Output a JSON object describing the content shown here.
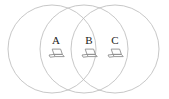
{
  "figure": {
    "type": "venn-diagram",
    "title": "",
    "background_color": "#ffffff",
    "circle_stroke_color": "#b9b9b9",
    "circle_stroke_width": 0.8,
    "label_color": "#222222",
    "icon_color": "#8f8f8f",
    "circles": [
      {
        "id": "circle-left",
        "cx": 52,
        "cy": 49,
        "r": 44
      },
      {
        "id": "circle-middle",
        "cx": 84,
        "cy": 49,
        "r": 44
      },
      {
        "id": "circle-right",
        "cx": 115,
        "cy": 49,
        "r": 44
      }
    ],
    "nodes": [
      {
        "id": "node-a",
        "label": "A",
        "icon": "laptop-icon",
        "x": 43,
        "y": 35
      },
      {
        "id": "node-b",
        "label": "B",
        "icon": "laptop-icon",
        "x": 76,
        "y": 35
      },
      {
        "id": "node-c",
        "label": "C",
        "icon": "laptop-icon",
        "x": 102,
        "y": 35
      }
    ]
  }
}
